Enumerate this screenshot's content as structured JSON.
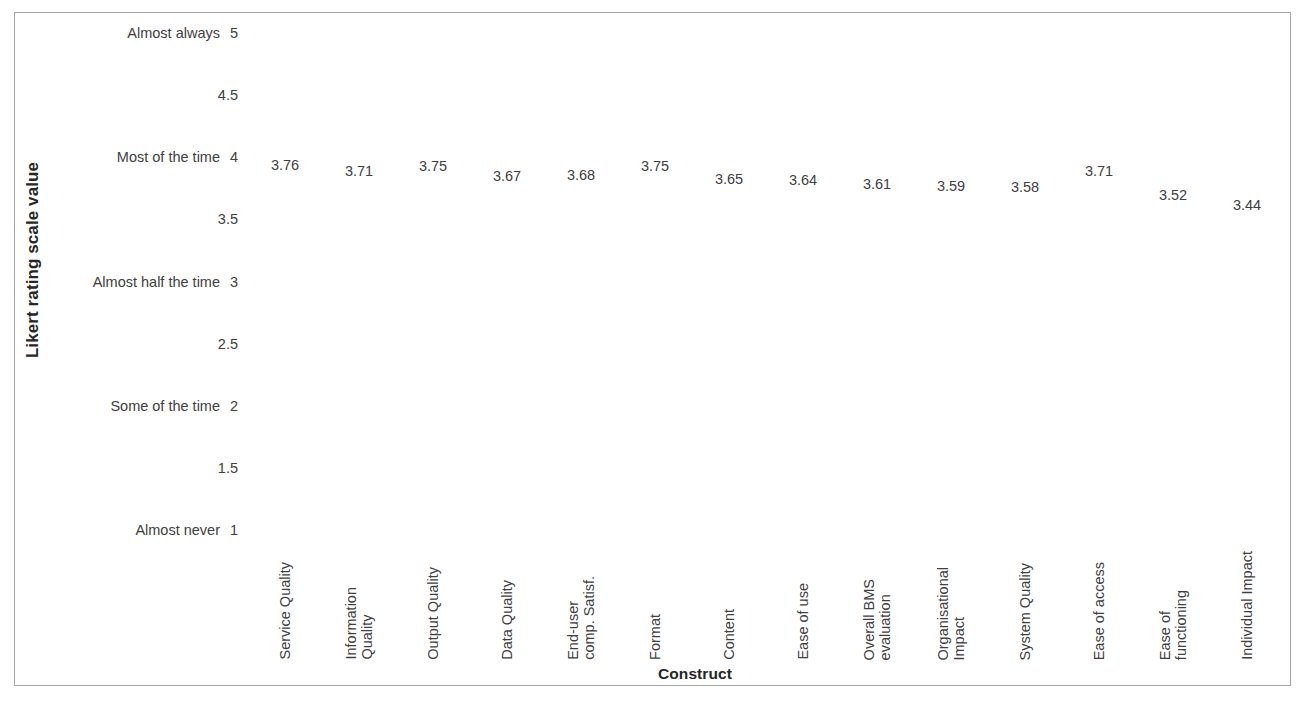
{
  "chart_data": {
    "type": "scatter",
    "title": "",
    "subtitle": "",
    "xlabel": "Construct",
    "ylabel": "Likert rating scale value",
    "grid": false,
    "legend": false,
    "legend_position": "none",
    "ylim": [
      1,
      5
    ],
    "y_tick_values": [
      5,
      4.5,
      4,
      3.5,
      3,
      2.5,
      2,
      1.5,
      1
    ],
    "y_tick_labels": [
      "5",
      "4.5",
      "4",
      "3.5",
      "3",
      "2.5",
      "2",
      "1.5",
      "1"
    ],
    "y_tick_descriptions": [
      "Almost always",
      "",
      "Most of the time",
      "",
      "Almost half the time",
      "",
      "Some of the time",
      "",
      "Almost never"
    ],
    "categories": [
      "Service Quality",
      "Information\nQuality",
      "Output Quality",
      "Data Quality",
      "End-user\ncomp. Satisf.",
      "Format",
      "Content",
      "Ease of use",
      "Overall BMS\nevaluation",
      "Organisational\nImpact",
      "System Quality",
      "Ease of access",
      "Ease of\nfunctioning",
      "Individual Impact"
    ],
    "values": [
      3.76,
      3.71,
      3.75,
      3.67,
      3.68,
      3.75,
      3.65,
      3.64,
      3.61,
      3.59,
      3.58,
      3.71,
      3.52,
      3.44
    ],
    "data_labels": [
      "3.76",
      "3.71",
      "3.75",
      "3.67",
      "3.68",
      "3.75",
      "3.65",
      "3.64",
      "3.61",
      "3.59",
      "3.58",
      "3.71",
      "3.52",
      "3.44"
    ],
    "series": [
      {
        "name": "Mean Likert rating",
        "values": [
          3.76,
          3.71,
          3.75,
          3.67,
          3.68,
          3.75,
          3.65,
          3.64,
          3.61,
          3.59,
          3.58,
          3.71,
          3.52,
          3.44
        ]
      }
    ],
    "marker_visible": false,
    "colors": {
      "text": "#404040",
      "axis_title": "#262626",
      "frame_border": "#a6a6a6",
      "background": "#ffffff"
    }
  }
}
